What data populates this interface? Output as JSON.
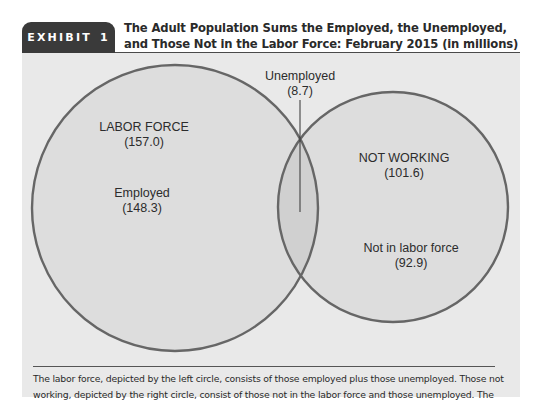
{
  "header": {
    "exhibit_label": "EXHIBIT",
    "exhibit_number": "1",
    "title_line1": "The Adult Population Sums the Employed, the Unemployed,",
    "title_line2": "and Those Not in the Labor Force: February 2015 (in millions)"
  },
  "diagram": {
    "type": "venn",
    "units": "millions",
    "sets": [
      {
        "name": "LABOR FORCE",
        "value": "(157.0)",
        "value_num": 157.0,
        "side": "left"
      },
      {
        "name": "NOT WORKING",
        "value": "(101.6)",
        "value_num": 101.6,
        "side": "right"
      }
    ],
    "regions": {
      "left_only": {
        "name": "Employed",
        "value": "(148.3)",
        "value_num": 148.3
      },
      "intersection": {
        "name": "Unemployed",
        "value": "(8.7)",
        "value_num": 8.7
      },
      "right_only": {
        "name": "Not in labor force",
        "value": "(92.9)",
        "value_num": 92.9
      }
    },
    "colors": {
      "panel": "#e9e9e9",
      "circle_fill": "#dddddd",
      "intersection_fill": "#d0d0d0",
      "stroke": "#666666"
    }
  },
  "caption": {
    "line1": "The labor force, depicted by the left circle, consists of those employed plus those unemployed. Those not",
    "line2": "working, depicted by the right circle, consist of those not in the labor force and those unemployed. The"
  }
}
